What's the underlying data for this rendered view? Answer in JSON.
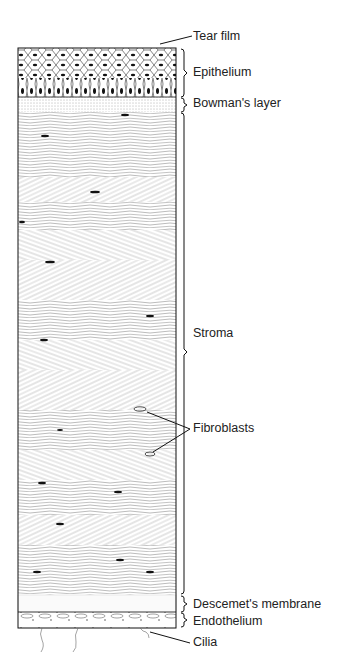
{
  "labels": {
    "tear_film": "Tear film",
    "epithelium": "Epithelium",
    "bowman": "Bowman's layer",
    "stroma": "Stroma",
    "fibroblasts": "Fibroblasts",
    "descemet": "Descemet's membrane",
    "endothelium": "Endothelium",
    "cilia": "Cilia"
  },
  "layers": [
    {
      "name": "Epithelium",
      "top": 48,
      "bottom": 97
    },
    {
      "name": "Bowman's layer",
      "top": 97,
      "bottom": 112
    },
    {
      "name": "Stroma",
      "top": 112,
      "bottom": 595
    },
    {
      "name": "Descemet's membrane",
      "top": 595,
      "bottom": 612
    },
    {
      "name": "Endothelium",
      "top": 612,
      "bottom": 628
    }
  ]
}
